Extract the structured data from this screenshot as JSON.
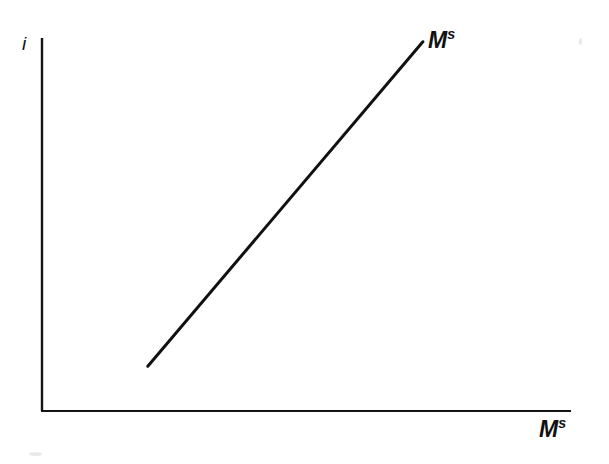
{
  "figure": {
    "background_color": "#ffffff",
    "ink_color": "#111111",
    "width": 609,
    "height": 464
  },
  "labels": {
    "y_axis": {
      "base": "i",
      "sup": "",
      "name": "interest-rate"
    },
    "x_axis": {
      "base": "M",
      "sup": "s",
      "name": "money-supply"
    },
    "curve": {
      "base": "M",
      "sup": "s",
      "name": "money-supply-curve"
    }
  },
  "chart_data": {
    "type": "line",
    "title": "",
    "subtitle": "",
    "xlabel": "M^s",
    "ylabel": "i",
    "xlim": [
      0,
      100
    ],
    "ylim": [
      0,
      100
    ],
    "grid": false,
    "legend": "none",
    "series": [
      {
        "name": "M^s",
        "label": "M^s",
        "x": [
          20,
          72
        ],
        "y": [
          12,
          99
        ],
        "style": "straight-line",
        "slope": "positive",
        "color": "#111111",
        "linewidth": 3
      }
    ],
    "annotations": [
      {
        "text": "M^s",
        "x": 76,
        "y": 100,
        "note": "curve label at upper right end of line"
      },
      {
        "text": "M^s",
        "x": 97,
        "y": -6,
        "note": "horizontal axis label"
      },
      {
        "text": "i",
        "x": -3,
        "y": 100,
        "note": "vertical axis label"
      }
    ],
    "axes": {
      "y_axis": {
        "x": 0,
        "y_from": 0,
        "y_to": 100,
        "ticks": [],
        "tick_labels": []
      },
      "x_axis": {
        "y": 0,
        "x_from": 0,
        "x_to": 100,
        "ticks": [],
        "tick_labels": []
      }
    }
  }
}
